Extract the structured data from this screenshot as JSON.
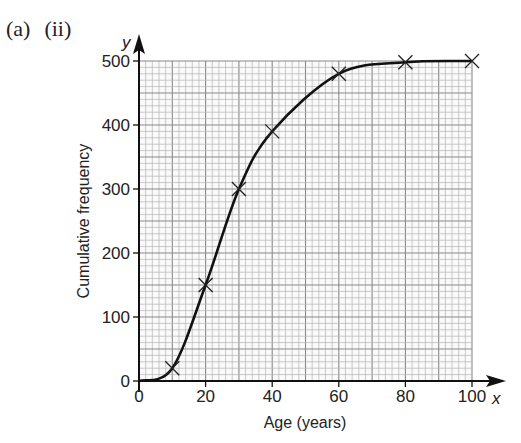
{
  "question": {
    "part": "(a)",
    "subpart": "(ii)"
  },
  "chart_data": {
    "type": "line",
    "title": "",
    "xlabel": "Age (years)",
    "ylabel": "Cumulative frequency",
    "x_axis_var": "x",
    "y_axis_var": "y",
    "xlim": [
      0,
      100
    ],
    "ylim": [
      0,
      500
    ],
    "x_ticks": [
      0,
      20,
      40,
      60,
      80,
      100
    ],
    "y_ticks": [
      0,
      100,
      200,
      300,
      400,
      500
    ],
    "grid": true,
    "series": [
      {
        "name": "Cumulative frequency curve",
        "x": [
          10,
          20,
          30,
          40,
          60,
          80,
          100
        ],
        "values": [
          20,
          150,
          300,
          390,
          480,
          498,
          500
        ],
        "marker": "x",
        "curve_starts_at": [
          0,
          0
        ]
      }
    ],
    "colors": {
      "line": "#111111",
      "grid_minor": "#b5b5b5",
      "grid_major": "#8a8a8a",
      "axis": "#111111"
    }
  }
}
